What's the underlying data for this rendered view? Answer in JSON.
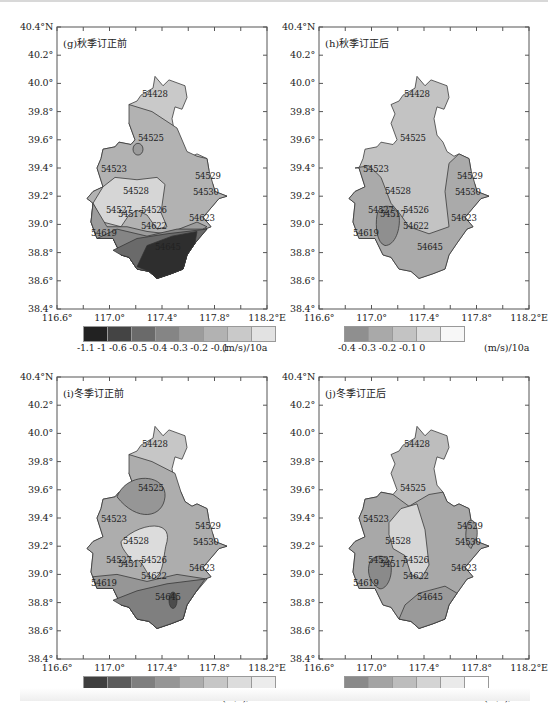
{
  "figure": {
    "caption_note": "Figure caption partially cropped at bottom edge"
  },
  "panels": [
    {
      "id": "g",
      "title": "(g)秋季订正前",
      "y_ticks": [
        "40.4°N",
        "40.2°",
        "40.0°",
        "39.8°",
        "39.6°",
        "39.4°",
        "39.2°",
        "39.0°",
        "38.8°",
        "38.6°",
        "38.4°"
      ],
      "x_ticks": [
        "116.6°",
        "117.0°",
        "117.4°",
        "117.8°",
        "118.2°E"
      ],
      "colorbar": {
        "ticks": [
          "-1.1",
          "-1",
          "-0.6",
          "-0.5",
          "-0.4",
          "-0.3",
          "-0.2",
          "-0.1"
        ],
        "tick_text": "-1.1 -1 -0.6 -0.5 -0.4 -0.3 -0.2 -0.1",
        "unit": "(m/s)/10a",
        "colors": [
          "#222222",
          "#444444",
          "#6a6a6a",
          "#858585",
          "#9c9c9c",
          "#b2b2b2",
          "#c9c9c9",
          "#e2e2e2"
        ]
      }
    },
    {
      "id": "h",
      "title": "(h)秋季订正后",
      "y_ticks": [
        "40.4°N",
        "40.2°",
        "40.0°",
        "39.8°",
        "39.6°",
        "39.4°",
        "39.2°",
        "39.0°",
        "38.8°",
        "38.6°",
        "38.4°"
      ],
      "x_ticks": [
        "116.6°",
        "117.0°",
        "117.4°",
        "117.8°",
        "118.2°E"
      ],
      "colorbar": {
        "ticks": [
          "-0.4",
          "-0.3",
          "-0.2",
          "-0.1",
          "0"
        ],
        "tick_text": "-0.4  -0.3  -0.2  -0.1   0",
        "unit": "(m/s)/10a",
        "colors": [
          "#8f8f8f",
          "#a9a9a9",
          "#c3c3c3",
          "#dcdcdc",
          "#f7f7f7"
        ]
      }
    },
    {
      "id": "i",
      "title": "(i)冬季订正前",
      "y_ticks": [
        "40.4°N",
        "40.2°",
        "40.0°",
        "39.8°",
        "39.6°",
        "39.4°",
        "39.2°",
        "39.0°",
        "38.8°",
        "38.6°",
        "38.4°"
      ],
      "x_ticks": [
        "116.6°",
        "117.0°",
        "117.4°",
        "117.8°",
        "118.2°E"
      ],
      "colorbar": {
        "ticks": [
          "-0.9",
          "-0.8",
          "-0.5",
          "-0.4",
          "-0.3",
          "-0.2",
          "-0.1"
        ],
        "tick_text": "-0.9 -0.8 -0.5 -0.4 -0.3 -0.2 -0.1",
        "unit": "(m/s)/10a",
        "colors": [
          "#3f3f3f",
          "#5c5c5c",
          "#7f7f7f",
          "#969696",
          "#adadad",
          "#c6c6c6",
          "#dcdcdc",
          "#ececec"
        ]
      }
    },
    {
      "id": "j",
      "title": "(j)冬季订正后",
      "y_ticks": [
        "40.4°N",
        "40.2°",
        "40.0°",
        "39.8°",
        "39.6°",
        "39.4°",
        "39.2°",
        "39.0°",
        "38.8°",
        "38.6°",
        "38.4°"
      ],
      "x_ticks": [
        "116.6°",
        "117.0°",
        "117.4°",
        "117.8°",
        "118.2°E"
      ],
      "colorbar": {
        "ticks": [
          "-0.5",
          "-0.4",
          "-0.3",
          "-0.2",
          "-0.1",
          "0"
        ],
        "tick_text": "-0.5 -0.4 -0.3 -0.2 -0.1   0",
        "unit": "(m/s)/10a",
        "colors": [
          "#8a8a8a",
          "#a4a4a4",
          "#bdbdbd",
          "#d4d4d4",
          "#eaeaea",
          "#ffffff"
        ]
      }
    }
  ],
  "stations": [
    "54428",
    "54525",
    "54523",
    "54528",
    "54529",
    "54530",
    "54527",
    "54517",
    "54526",
    "54622",
    "54623",
    "54619",
    "54645"
  ],
  "chart_data": [
    {
      "type": "heatmap",
      "title": "(g)秋季订正前",
      "xlabel": "Longitude",
      "ylabel": "Latitude",
      "xlim": [
        116.6,
        118.2
      ],
      "ylim": [
        38.4,
        40.4
      ],
      "legend": {
        "position": "bottom",
        "unit": "(m/s)/10a",
        "levels": [
          -1.1,
          -1,
          -0.6,
          -0.5,
          -0.4,
          -0.3,
          -0.2,
          -0.1
        ]
      },
      "regions": [
        {
          "area": "north (54428)",
          "range": "-0.2 to -0.1"
        },
        {
          "area": "central (54525, 54523, 54529, 54530)",
          "range": "-0.3 to -0.2"
        },
        {
          "area": "54528/54526 west-central lobe",
          "range": "-0.2 to -0.1"
        },
        {
          "area": "54619 southwest",
          "range": "-0.3 to -0.4"
        },
        {
          "area": "southeast 54645",
          "range": "-1.1 to -0.6"
        }
      ]
    },
    {
      "type": "heatmap",
      "title": "(h)秋季订正后",
      "xlim": [
        116.6,
        118.2
      ],
      "ylim": [
        38.4,
        40.4
      ],
      "legend": {
        "position": "bottom",
        "unit": "(m/s)/10a",
        "levels": [
          -0.4,
          -0.3,
          -0.2,
          -0.1,
          0
        ]
      },
      "regions": [
        {
          "area": "north & center (54428, 54525, 54528, 54526, 54622)",
          "range": "-0.2 to -0.1"
        },
        {
          "area": "west/east/south (54523, 54530, 54623, 54645, 54619)",
          "range": "-0.3 to -0.2"
        },
        {
          "area": "small oval near 54527/54517",
          "range": "-0.4 to -0.3"
        }
      ]
    },
    {
      "type": "heatmap",
      "title": "(i)冬季订正前",
      "xlim": [
        116.6,
        118.2
      ],
      "ylim": [
        38.4,
        40.4
      ],
      "legend": {
        "position": "bottom",
        "unit": "(m/s)/10a",
        "levels": [
          -0.9,
          -0.8,
          -0.5,
          -0.4,
          -0.3,
          -0.2,
          -0.1
        ]
      },
      "regions": [
        {
          "area": "north 54428",
          "range": "-0.2 to -0.1"
        },
        {
          "area": "54525 oval",
          "range": "-0.4 to -0.3"
        },
        {
          "area": "center (54523, 54529, 54530, 54623)",
          "range": "-0.3 to -0.2"
        },
        {
          "area": "54528/54526/54622 lobe",
          "range": "-0.2 to -0.1"
        },
        {
          "area": "south (54645)",
          "range": "-0.5 to -0.4"
        },
        {
          "area": "small oval at 54645",
          "range": "-0.9 to -0.8"
        }
      ]
    },
    {
      "type": "heatmap",
      "title": "(j)冬季订正后",
      "xlim": [
        116.6,
        118.2
      ],
      "ylim": [
        38.4,
        40.4
      ],
      "legend": {
        "position": "bottom",
        "unit": "(m/s)/10a",
        "levels": [
          -0.5,
          -0.4,
          -0.3,
          -0.2,
          -0.1,
          0
        ]
      },
      "regions": [
        {
          "area": "north 54428",
          "range": "-0.2 to -0.1"
        },
        {
          "area": "central lobe (54528, 54526, 54622)",
          "range": "-0.2 to -0.1"
        },
        {
          "area": "surrounding (54523, 54619, 54623)",
          "range": "-0.3 to -0.2"
        },
        {
          "area": "54527 oval, 54529/54530 east, south 54645",
          "range": "-0.4 to -0.3"
        }
      ]
    }
  ]
}
